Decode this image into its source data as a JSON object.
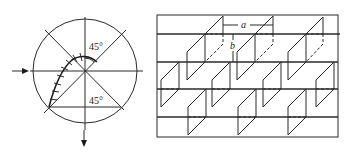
{
  "figure": {
    "left_panel": {
      "name": "circle-projection-diagram",
      "angle_top_label": "45°",
      "angle_bottom_label": "45°",
      "input_arrow": "right-arrow",
      "output_arrow": "down-arrow"
    },
    "right_panel": {
      "name": "staggered-fin-array-diagram",
      "dimension_a_label": "a",
      "dimension_b_label": "b"
    }
  }
}
